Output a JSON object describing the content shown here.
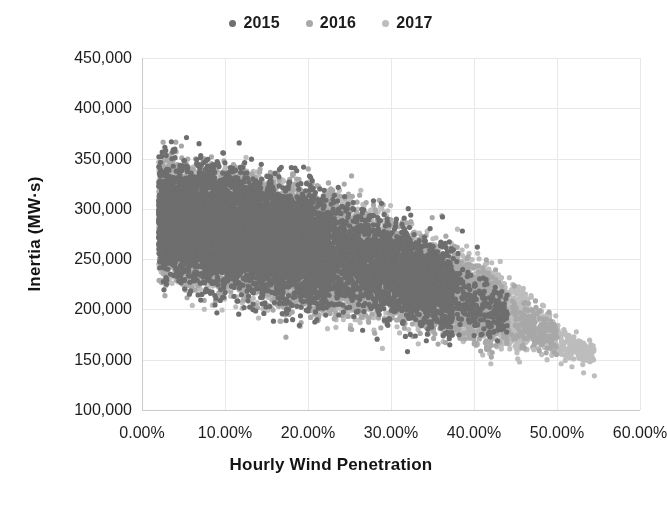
{
  "chart_data": {
    "type": "scatter",
    "title": "",
    "xlabel": "Hourly Wind Penetration",
    "ylabel": "Inertia (MW·s)",
    "xlim": [
      0,
      0.6
    ],
    "ylim": [
      100000,
      450000
    ],
    "xtick_labels": [
      "0.00%",
      "10.00%",
      "20.00%",
      "30.00%",
      "40.00%",
      "50.00%",
      "60.00%"
    ],
    "xtick_values": [
      0,
      0.1,
      0.2,
      0.3,
      0.4,
      0.5,
      0.6
    ],
    "ytick_labels": [
      "450,000",
      "400,000",
      "350,000",
      "300,000",
      "250,000",
      "200,000",
      "150,000",
      "100,000"
    ],
    "ytick_values": [
      450000,
      400000,
      350000,
      300000,
      250000,
      200000,
      150000,
      100000
    ],
    "grid": true,
    "grid_color": "#e8e8e8",
    "axis_color": "#c9c9c9",
    "legend_position": "top-center",
    "point_radius": 2.6,
    "series": [
      {
        "name": "2015",
        "color": "#6e6e6e",
        "n_points": 8760,
        "x_range": [
          0.0,
          0.44
        ],
        "y_range": [
          150000,
          395000
        ],
        "envelope": {
          "top": [
            [
              0.0,
              372000
            ],
            [
              0.012,
              392000
            ],
            [
              0.035,
              388000
            ],
            [
              0.06,
              381000
            ],
            [
              0.09,
              380000
            ],
            [
              0.12,
              374000
            ],
            [
              0.17,
              365000
            ],
            [
              0.22,
              352000
            ],
            [
              0.27,
              335000
            ],
            [
              0.32,
              312000
            ],
            [
              0.37,
              285000
            ],
            [
              0.41,
              258000
            ],
            [
              0.44,
              232000
            ]
          ],
          "bottom": [
            [
              0.0,
              205000
            ],
            [
              0.03,
              198000
            ],
            [
              0.07,
              188000
            ],
            [
              0.12,
              178000
            ],
            [
              0.18,
              168000
            ],
            [
              0.25,
              160000
            ],
            [
              0.32,
              154000
            ],
            [
              0.38,
              150000
            ],
            [
              0.44,
              150000
            ]
          ]
        },
        "density_core": [
          0.02,
          0.22
        ],
        "notes": "Darkest series; forms the upper crust of the cloud and scattered outliers along the upper-right envelope."
      },
      {
        "name": "2016",
        "color": "#a8a8a8",
        "n_points": 8784,
        "x_range": [
          0.0,
          0.5
        ],
        "y_range": [
          140000,
          385000
        ],
        "envelope": {
          "top": [
            [
              0.0,
              370000
            ],
            [
              0.02,
              384000
            ],
            [
              0.05,
              378000
            ],
            [
              0.09,
              378000
            ],
            [
              0.13,
              370000
            ],
            [
              0.18,
              360000
            ],
            [
              0.24,
              344000
            ],
            [
              0.29,
              325000
            ],
            [
              0.34,
              302000
            ],
            [
              0.39,
              276000
            ],
            [
              0.44,
              245000
            ],
            [
              0.48,
              215000
            ],
            [
              0.5,
              198000
            ]
          ],
          "bottom": [
            [
              0.0,
              203000
            ],
            [
              0.04,
              193000
            ],
            [
              0.09,
              182000
            ],
            [
              0.15,
              172000
            ],
            [
              0.22,
              162000
            ],
            [
              0.3,
              153000
            ],
            [
              0.38,
              146000
            ],
            [
              0.45,
              142000
            ],
            [
              0.5,
              140000
            ]
          ]
        },
        "density_core": [
          0.02,
          0.26
        ],
        "notes": "Mid-grey series; fills the bulk of the central cloud."
      },
      {
        "name": "2017",
        "color": "#bdbdbd",
        "n_points": 8760,
        "x_range": [
          0.0,
          0.545
        ],
        "y_range": [
          132000,
          382000
        ],
        "envelope": {
          "top": [
            [
              0.0,
              368000
            ],
            [
              0.025,
              380000
            ],
            [
              0.06,
              376000
            ],
            [
              0.1,
              374000
            ],
            [
              0.15,
              366000
            ],
            [
              0.2,
              355000
            ],
            [
              0.26,
              339000
            ],
            [
              0.31,
              320000
            ],
            [
              0.36,
              297000
            ],
            [
              0.42,
              266000
            ],
            [
              0.47,
              232000
            ],
            [
              0.51,
              200000
            ],
            [
              0.545,
              175000
            ]
          ],
          "bottom": [
            [
              0.0,
              200000
            ],
            [
              0.05,
              190000
            ],
            [
              0.11,
              179000
            ],
            [
              0.18,
              168000
            ],
            [
              0.26,
              158000
            ],
            [
              0.34,
              149000
            ],
            [
              0.42,
              141000
            ],
            [
              0.49,
              136000
            ],
            [
              0.545,
              132000
            ]
          ]
        },
        "density_core": [
          0.02,
          0.28
        ],
        "notes": "Lightest series; extends furthest right with sparse outliers near 50-55% penetration at ~135,000 MW·s."
      }
    ],
    "outliers": [
      {
        "x": 0.455,
        "y": 168000,
        "series": "2017"
      },
      {
        "x": 0.472,
        "y": 160000,
        "series": "2017"
      },
      {
        "x": 0.488,
        "y": 150000,
        "series": "2017"
      },
      {
        "x": 0.505,
        "y": 146000,
        "series": "2017"
      },
      {
        "x": 0.518,
        "y": 143000,
        "series": "2017"
      },
      {
        "x": 0.532,
        "y": 137000,
        "series": "2017"
      },
      {
        "x": 0.545,
        "y": 134000,
        "series": "2017"
      },
      {
        "x": 0.404,
        "y": 262000,
        "series": "2015"
      },
      {
        "x": 0.386,
        "y": 278000,
        "series": "2015"
      },
      {
        "x": 0.362,
        "y": 292000,
        "series": "2015"
      }
    ]
  },
  "legend": {
    "entries": [
      {
        "label": "2015",
        "color": "#6e6e6e"
      },
      {
        "label": "2016",
        "color": "#a8a8a8"
      },
      {
        "label": "2017",
        "color": "#bdbdbd"
      }
    ]
  },
  "plot_geometry": {
    "left": 142,
    "right": 640,
    "top": 58,
    "bottom": 410
  }
}
